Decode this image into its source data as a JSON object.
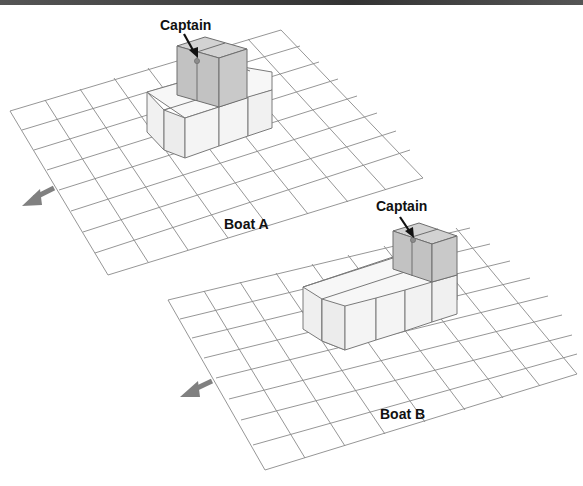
{
  "figure": {
    "top_rule": true,
    "boats": [
      {
        "id": "A",
        "label": "Boat A",
        "label_pos": [
          224,
          229
        ],
        "captain_label": "Captain",
        "captain_label_pos": [
          160,
          30
        ],
        "direction_arrow": "points toward lower-left (bow direction)"
      },
      {
        "id": "B",
        "label": "Boat B",
        "label_pos": [
          380,
          419
        ],
        "captain_label": "Captain",
        "captain_label_pos": [
          376,
          211
        ],
        "direction_arrow": "points toward lower-left (bow direction)"
      }
    ]
  },
  "colors": {
    "grid": "#8a8a8a",
    "cube_light_top": "#f6f6f6",
    "cube_light_front": "#efefef",
    "cube_light_side": "#e2e2e2",
    "cube_dark_top": "#cfcfcf",
    "cube_dark_front": "#bdbdbd",
    "cube_dark_side": "#c6c6c6",
    "arrow": "#808080",
    "captain_dot": "#888888"
  }
}
